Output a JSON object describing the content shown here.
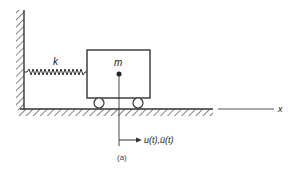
{
  "diagram": {
    "labels": {
      "spring": "k",
      "mass": "m",
      "axis": "x",
      "response": "u(t),ü(t)",
      "caption": "(a)"
    },
    "colors": {
      "line": "#333333",
      "background": "#ffffff"
    }
  }
}
